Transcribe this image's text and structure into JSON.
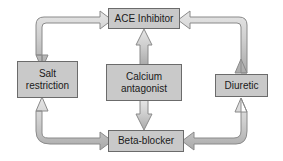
{
  "diagram": {
    "background_color": "#ffffff",
    "node_fill_color": "#c9c9c9",
    "node_border_color": "#6b6b6b",
    "arrow_fill_color": "#c9c9c9",
    "arrow_outline_color": "#8a8a8a",
    "text_color": "#1a1a1a",
    "nodes": [
      {
        "id": "ace",
        "label": "ACE Inhibitor"
      },
      {
        "id": "salt",
        "label": "Salt\nrestriction"
      },
      {
        "id": "calcium",
        "label": "Calcium\nantagonist"
      },
      {
        "id": "diuretic",
        "label": "Diuretic"
      },
      {
        "id": "beta",
        "label": "Beta-blocker"
      }
    ],
    "edges": [
      {
        "id": "salt-ace",
        "from": "Salt restriction",
        "to": "ACE Inhibitor",
        "style": "elbow",
        "direction": "bidirectional"
      },
      {
        "id": "ace-diuretic",
        "from": "ACE Inhibitor",
        "to": "Diuretic",
        "style": "elbow",
        "direction": "bidirectional"
      },
      {
        "id": "beta-salt",
        "from": "Beta-blocker",
        "to": "Salt restriction",
        "style": "elbow",
        "direction": "bidirectional"
      },
      {
        "id": "diuretic-beta",
        "from": "Diuretic",
        "to": "Beta-blocker",
        "style": "elbow",
        "direction": "bidirectional"
      },
      {
        "id": "calcium-ace",
        "from": "Calcium antagonist",
        "to": "ACE Inhibitor",
        "style": "straight",
        "direction": "up"
      },
      {
        "id": "calcium-beta",
        "from": "Calcium antagonist",
        "to": "Beta-blocker",
        "style": "straight",
        "direction": "down"
      }
    ]
  }
}
